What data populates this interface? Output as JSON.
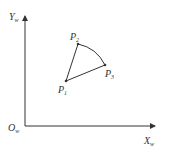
{
  "diagram": {
    "type": "coordinate-sketch",
    "axes": {
      "origin_label": "O",
      "origin_sub": "w",
      "x_label": "X",
      "x_sub": "w",
      "y_label": "Y",
      "y_sub": "w"
    },
    "points": [
      {
        "name": "P",
        "sub": "1",
        "x": 66,
        "y": 81
      },
      {
        "name": "P",
        "sub": "2",
        "x": 78,
        "y": 44
      },
      {
        "name": "P",
        "sub": "3",
        "x": 105,
        "y": 65
      }
    ],
    "edges": [
      {
        "from": "P1",
        "to": "P2",
        "kind": "line"
      },
      {
        "from": "P1",
        "to": "P3",
        "kind": "line"
      },
      {
        "from": "P2",
        "to": "P3",
        "kind": "arc"
      }
    ],
    "colors": {
      "stroke": "#333333",
      "background": "#ffffff"
    }
  }
}
